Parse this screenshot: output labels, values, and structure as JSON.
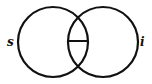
{
  "diagram": {
    "type": "venn",
    "labels": {
      "left": "s",
      "right": "i"
    },
    "stroke_color": "#111111",
    "background": "#ffffff",
    "circles": [
      {
        "name": "left",
        "cx": 53,
        "cy": 42,
        "r": 35
      },
      {
        "name": "right",
        "cx": 103,
        "cy": 42,
        "r": 35
      }
    ],
    "intersection_divider": {
      "x1": 69,
      "y1": 41,
      "x2": 87,
      "y2": 41
    }
  }
}
